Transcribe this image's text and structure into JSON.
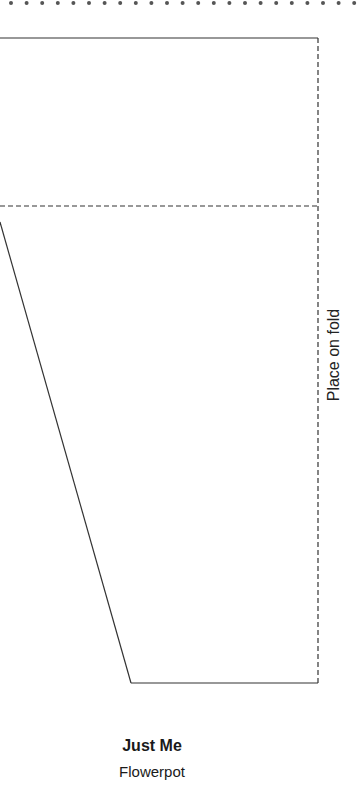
{
  "pattern": {
    "fold_label": "Place on fold",
    "title": "Just Me",
    "subtitle": "Flowerpot",
    "stroke_color": "#333333",
    "dot_color": "#555555",
    "geometry": {
      "dot_row_y": 3,
      "dot_spacing": 15.6,
      "top_edge_y": 38,
      "fold_line_x": 318,
      "rim_line_y": 206,
      "diagonal_start": [
        0,
        222
      ],
      "diagonal_end": [
        131,
        683
      ],
      "bottom_edge_y": 683
    }
  }
}
